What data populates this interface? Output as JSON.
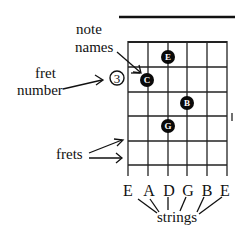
{
  "labels": {
    "note_names_line1": "note",
    "note_names_line2": "names",
    "fret_number_line1": "fret",
    "fret_number_line2": "number",
    "frets": "frets",
    "strings": "strings"
  },
  "fret_number": "3",
  "string_names": [
    "E",
    "A",
    "D",
    "G",
    "B",
    "E"
  ],
  "notes": [
    {
      "name": "E",
      "string": 3,
      "fret": 1
    },
    {
      "name": "C",
      "string": 2,
      "fret": 2
    },
    {
      "name": "B",
      "string": 4,
      "fret": 3
    },
    {
      "name": "G",
      "string": 3,
      "fret": 4
    }
  ]
}
